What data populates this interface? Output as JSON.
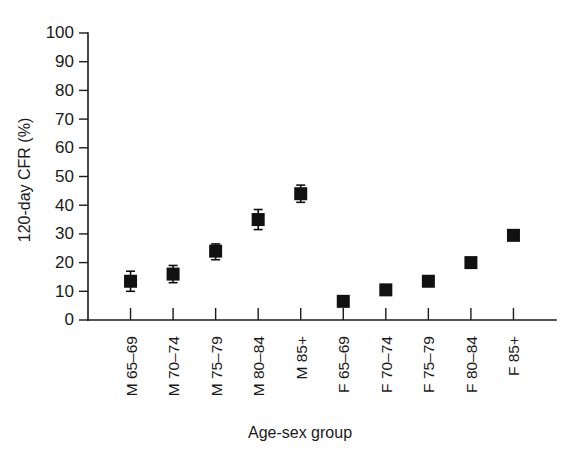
{
  "chart_data": {
    "type": "scatter",
    "title": "",
    "xlabel": "Age-sex group",
    "ylabel": "120-day CFR (%)",
    "ylim": [
      0,
      100
    ],
    "ytick_labels": [
      "0",
      "10",
      "20",
      "30",
      "40",
      "50",
      "60",
      "70",
      "80",
      "90",
      "100"
    ],
    "ytick_values": [
      0,
      10,
      20,
      30,
      40,
      50,
      60,
      70,
      80,
      90,
      100
    ],
    "grid": false,
    "legend": "none",
    "categories": [
      "M 65–69",
      "M 70–74",
      "M 75–79",
      "M 80–84",
      "M 85+",
      "F 65–69",
      "F 70–74",
      "F 75–79",
      "F 80–84",
      "F 85+"
    ],
    "series": [
      {
        "name": "120-day CFR",
        "values": [
          13.5,
          16.0,
          24.0,
          35.0,
          44.0,
          6.5,
          10.5,
          13.5,
          20.0,
          29.5
        ],
        "error_low": [
          10.0,
          13.0,
          21.0,
          31.5,
          41.0,
          5.5,
          9.5,
          12.5,
          19.0,
          28.5
        ],
        "error_high": [
          17.0,
          19.0,
          26.5,
          38.5,
          47.0,
          8.0,
          11.5,
          14.5,
          21.0,
          30.5
        ]
      }
    ],
    "marker_style": "filled-square",
    "errorbar_style": "capped-vertical"
  },
  "colors": {
    "marker": "#111111",
    "axis": "#1a1a1a",
    "background": "#ffffff"
  }
}
